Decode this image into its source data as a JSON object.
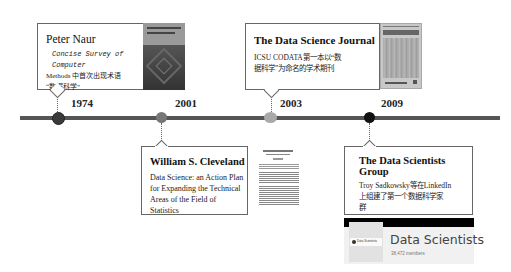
{
  "timeline": {
    "line_color": "#555555",
    "events": [
      {
        "year": "1974",
        "dot_color": "#3a3a3a",
        "title": "Peter Naur",
        "body_line1": "Concise Survey of Computer",
        "body_line2": "Methods 中首次出现术语",
        "body_line3": "“数据科学”",
        "thumbnail": "book-cover-concise-survey"
      },
      {
        "year": "2001",
        "dot_color": "#777777",
        "title": "William  S. Cleveland",
        "body_line1": "Data Science: an Action Plan",
        "body_line2": "for Expanding the Technical",
        "body_line3": "Areas of the Field of Statistics",
        "thumbnail": "paper-first-page"
      },
      {
        "year": "2003",
        "dot_color": "#a9a9a9",
        "title": "The Data Science Journal",
        "body_line1": "ICSU CODATA第一本以“数",
        "body_line2": "据科学”为命名的学术期刊",
        "thumbnail": "journal-cover"
      },
      {
        "year": "2009",
        "dot_color": "#111111",
        "title": "The Data Scientists Group",
        "body_line1": "Troy Sadkowsky等在LinkedIn",
        "body_line2": "上组建了第一个数据科学家",
        "body_line3": "群",
        "thumbnail": "linkedin-group-banner"
      }
    ]
  },
  "linkedin_card": {
    "group_name": "Data Scientists",
    "members": "38,472 members",
    "logo_text": "Data Scientists"
  }
}
